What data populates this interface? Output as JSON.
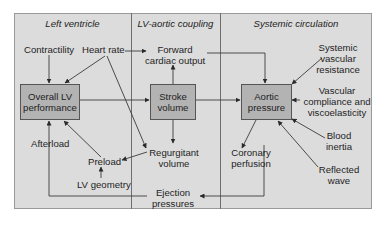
{
  "diagram": {
    "sections": [
      {
        "title": "Left ventricle"
      },
      {
        "title": "LV-aortic coupling"
      },
      {
        "title": "Systemic circulation"
      }
    ],
    "boxes": {
      "overall_lv": "Overall LV performance",
      "stroke_volume": "Stroke volume",
      "aortic_pressure": "Aortic pressure"
    },
    "labels": {
      "contractility": "Contractility",
      "heart_rate": "Heart rate",
      "afterload": "Afterload",
      "preload": "Preload",
      "lv_geometry": "LV geometry",
      "forward_cardiac_output_1": "Forward",
      "forward_cardiac_output_2": "cardiac output",
      "regurgitant_volume_1": "Regurgitant",
      "regurgitant_volume_2": "volume",
      "ejection_pressures_1": "Ejection",
      "ejection_pressures_2": "pressures",
      "svr_1": "Systemic",
      "svr_2": "vascular",
      "svr_3": "resistance",
      "compliance_1": "Vascular",
      "compliance_2": "compliance and",
      "compliance_3": "viscoelasticity",
      "blood_inertia_1": "Blood",
      "blood_inertia_2": "inertia",
      "reflected_wave_1": "Reflected",
      "reflected_wave_2": "wave",
      "coronary_1": "Coronary",
      "coronary_2": "perfusion"
    },
    "box_lines": {
      "overall_lv_1": "Overall LV",
      "overall_lv_2": "performance",
      "stroke_volume_1": "Stroke",
      "stroke_volume_2": "volume",
      "aortic_pressure_1": "Aortic",
      "aortic_pressure_2": "pressure"
    },
    "colors": {
      "background": "#dcdcdc",
      "box_fill": "#b3b3b3",
      "line": "#3a3a3a"
    }
  }
}
